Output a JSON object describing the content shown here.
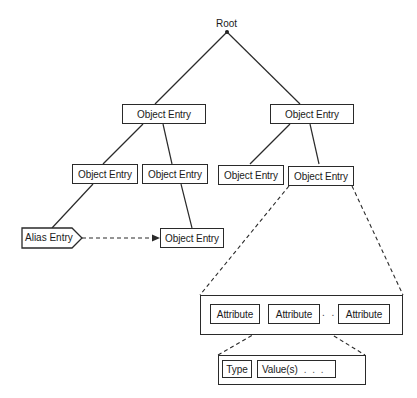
{
  "diagram": {
    "type": "tree",
    "root": {
      "label": "Root"
    },
    "level1": [
      {
        "label": "Object Entry"
      },
      {
        "label": "Object Entry"
      }
    ],
    "level2": [
      {
        "label": "Object Entry"
      },
      {
        "label": "Object Entry"
      },
      {
        "label": "Object Entry"
      },
      {
        "label": "Object Entry"
      }
    ],
    "alias_entry": {
      "label": "Alias Entry"
    },
    "alias_target": {
      "label": "Object Entry"
    },
    "attributes": {
      "items": [
        {
          "label": "Attribute"
        },
        {
          "label": "Attribute"
        },
        {
          "label": "Attribute"
        }
      ],
      "ellipsis": ". . ."
    },
    "attribute_detail": {
      "type_label": "Type",
      "value_label": "Value(s)",
      "value_ellipsis": ". . ."
    },
    "colors": {
      "line": "#2a2a2a",
      "background": "#ffffff"
    }
  }
}
